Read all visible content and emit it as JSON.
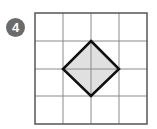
{
  "problem": {
    "number": "4",
    "badge_color": "#6b6b6b"
  },
  "figure": {
    "grid": {
      "rows": 4,
      "cols": 4,
      "line_color": "#8a8a8a",
      "border_color": "#555555"
    },
    "shape": {
      "type": "square-rotated-45",
      "vertices_grid_units": [
        [
          2,
          1
        ],
        [
          3,
          2
        ],
        [
          2,
          3
        ],
        [
          1,
          2
        ]
      ],
      "fill": "#e0e0e0",
      "stroke": "#111111"
    }
  }
}
